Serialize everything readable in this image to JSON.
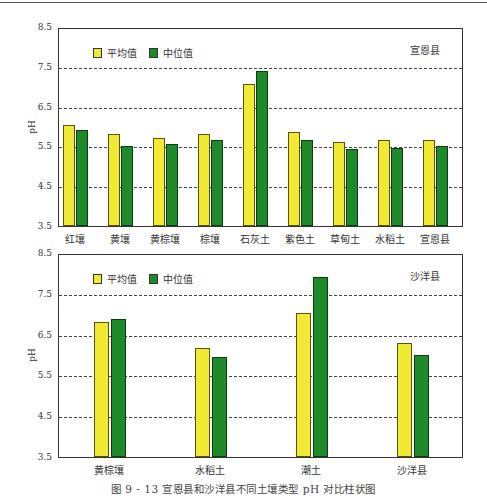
{
  "caption": "图 9 - 13   宣恩县和沙洋县不同土壤类型 pH 对比柱状图",
  "colors": {
    "mean": "#f2e935",
    "median": "#1f8a2a"
  },
  "legend": {
    "mean": "平均值",
    "median": "中位值"
  },
  "chart_data": [
    {
      "type": "bar",
      "title": "宣恩县",
      "ylabel": "pH",
      "xlabel": "",
      "ylim": [
        3.5,
        8.5
      ],
      "yticks": [
        "3.5",
        "4.5",
        "5.5",
        "6.5",
        "7.5",
        "8.5"
      ],
      "grid": "dashed horizontal at 4.5, 5.5, 6.5, 7.5",
      "legend_position": "top-left",
      "categories": [
        "红壤",
        "黄壤",
        "黄棕壤",
        "棕壤",
        "石灰土",
        "紫色土",
        "草甸土",
        "水稻土",
        "宣恩县"
      ],
      "series": [
        {
          "name": "平均值",
          "color": "#f2e935",
          "values": [
            6.05,
            5.8,
            5.72,
            5.8,
            7.07,
            5.85,
            5.6,
            5.67,
            5.67
          ]
        },
        {
          "name": "中位值",
          "color": "#1f8a2a",
          "values": [
            5.9,
            5.52,
            5.55,
            5.65,
            7.4,
            5.67,
            5.43,
            5.45,
            5.52
          ]
        }
      ]
    },
    {
      "type": "bar",
      "title": "沙洋县",
      "ylabel": "pH",
      "xlabel": "",
      "ylim": [
        3.5,
        8.5
      ],
      "yticks": [
        "3.5",
        "4.5",
        "5.5",
        "6.5",
        "7.5",
        "8.5"
      ],
      "grid": "dashed horizontal at 4.5, 5.5, 6.5, 7.5",
      "legend_position": "top-left",
      "categories": [
        "黄棕壤",
        "水稻土",
        "潮土",
        "沙洋县"
      ],
      "series": [
        {
          "name": "平均值",
          "color": "#f2e935",
          "values": [
            6.8,
            6.18,
            7.04,
            6.3
          ]
        },
        {
          "name": "中位值",
          "color": "#1f8a2a",
          "values": [
            6.88,
            5.96,
            7.91,
            6.0
          ]
        }
      ]
    }
  ]
}
